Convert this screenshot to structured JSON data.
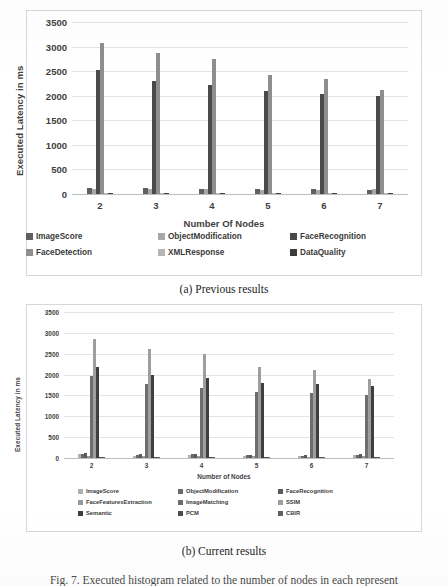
{
  "figure": {
    "caption_partial": "Fig. 7. Executed histogram related to the number of nodes in each represent",
    "subcaption_a": "(a) Previous results",
    "subcaption_b": "(b) Current results"
  },
  "chart_data": [
    {
      "id": "previous-results",
      "type": "bar",
      "title": "(a) Previous results",
      "xlabel": "Number Of Nodes",
      "ylabel": "Executed Latency in ms",
      "categories": [
        "2",
        "3",
        "4",
        "5",
        "6",
        "7"
      ],
      "yticks": [
        0,
        500,
        1000,
        1500,
        2000,
        2500,
        3000,
        3500
      ],
      "ylim": [
        0,
        3500
      ],
      "grid": true,
      "legend_position": "bottom",
      "series": [
        {
          "name": "ImageScore",
          "color": "#5f5f5f",
          "values": [
            120,
            118,
            105,
            92,
            95,
            88
          ]
        },
        {
          "name": "ObjectModification",
          "color": "#a8a8a8",
          "values": [
            112,
            108,
            96,
            90,
            86,
            92
          ]
        },
        {
          "name": "FaceRecognition",
          "color": "#4a4a4a",
          "values": [
            2530,
            2290,
            2215,
            2090,
            2045,
            1990
          ]
        },
        {
          "name": "FaceDetection",
          "color": "#8e8e8e",
          "values": [
            3080,
            2860,
            2755,
            2425,
            2350,
            2120
          ]
        },
        {
          "name": "XMLResponse",
          "color": "#b5b5b5",
          "values": [
            30,
            28,
            26,
            24,
            22,
            20
          ]
        },
        {
          "name": "DataQuality",
          "color": "#3c3c3c",
          "values": [
            18,
            16,
            15,
            14,
            13,
            12
          ]
        }
      ]
    },
    {
      "id": "current-results",
      "type": "bar",
      "title": "(b) Current results",
      "xlabel": "Number of Nodes",
      "ylabel": "Executed Latency in ms",
      "categories": [
        "2",
        "3",
        "4",
        "5",
        "6",
        "7"
      ],
      "yticks": [
        0,
        500,
        1000,
        1500,
        2000,
        2500,
        3000,
        3500
      ],
      "ylim": [
        0,
        3500
      ],
      "grid": true,
      "legend_position": "bottom",
      "series": [
        {
          "name": "ImageScore",
          "color": "#b0b0b0",
          "values": [
            95,
            55,
            70,
            48,
            45,
            62
          ]
        },
        {
          "name": "ObjectModification",
          "color": "#6a6a6a",
          "values": [
            105,
            70,
            85,
            62,
            58,
            72
          ]
        },
        {
          "name": "FaceRecognition",
          "color": "#5a5a5a",
          "values": [
            128,
            92,
            105,
            80,
            74,
            90
          ]
        },
        {
          "name": "FaceFeaturesExtraction",
          "color": "#9a9a9a",
          "values": [
            60,
            42,
            55,
            38,
            36,
            44
          ]
        },
        {
          "name": "ImageMatching",
          "color": "#6e6e6e",
          "values": [
            1955,
            1765,
            1690,
            1585,
            1555,
            1500
          ]
        },
        {
          "name": "SSIM",
          "color": "#9e9e9e",
          "values": [
            2860,
            2620,
            2505,
            2185,
            2105,
            1900
          ]
        },
        {
          "name": "Semantic",
          "color": "#3f3f3f",
          "values": [
            2180,
            1995,
            1915,
            1805,
            1770,
            1715
          ]
        },
        {
          "name": "PCM",
          "color": "#4d4d4d",
          "values": [
            22,
            20,
            19,
            18,
            17,
            16
          ]
        },
        {
          "name": "CBIR",
          "color": "#606060",
          "values": [
            16,
            15,
            14,
            13,
            12,
            11
          ]
        }
      ]
    }
  ]
}
